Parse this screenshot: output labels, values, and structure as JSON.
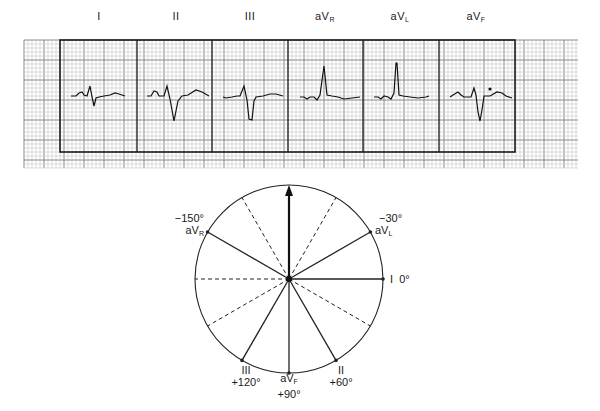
{
  "ecg_strip": {
    "leads": [
      {
        "name": "I",
        "sub": "",
        "x": 99
      },
      {
        "name": "II",
        "sub": "",
        "x": 176
      },
      {
        "name": "III",
        "sub": "",
        "x": 250
      },
      {
        "name": "aV",
        "sub": "R",
        "x": 325
      },
      {
        "name": "aV",
        "sub": "L",
        "x": 400
      },
      {
        "name": "aV",
        "sub": "F",
        "x": 476
      }
    ],
    "grid": {
      "x0": 24,
      "x1": 578,
      "y0": 40,
      "y1": 168,
      "small": 4,
      "large": 20
    },
    "frame": {
      "x0": 60,
      "x1": 515,
      "y0": 40,
      "y1": 152,
      "dividers": [
        137,
        212,
        288,
        363,
        439
      ]
    },
    "colors": {
      "grid_minor": "#b9b9b9",
      "grid_major": "#7d7d7d",
      "frame": "#1a1a1a",
      "trace": "#111111"
    }
  },
  "hexaxial": {
    "center": [
      289,
      279
    ],
    "radius": 94,
    "solid_axes": [
      {
        "lead": "I",
        "angle": 0
      },
      {
        "lead": "II",
        "angle": 60
      },
      {
        "lead": "aVF",
        "angle": 90
      },
      {
        "lead": "III",
        "angle": 120
      },
      {
        "lead": "aVR",
        "angle": -150
      },
      {
        "lead": "aVL",
        "angle": -30
      }
    ],
    "dashed_axes": [
      180,
      -120,
      -60,
      30,
      150
    ],
    "arrow_angle": -90,
    "labels": {
      "avr_deg": "−150°",
      "avr_lead": "aV",
      "avr_sub": "R",
      "avl_deg": "−30°",
      "avl_lead": "aV",
      "avl_sub": "L",
      "i_lead": "I",
      "i_deg": "0°",
      "iii_lead": "III",
      "iii_deg": "+120°",
      "avf_lead": "aV",
      "avf_sub": "F",
      "avf_deg": "+90°",
      "ii_lead": "II",
      "ii_deg": "+60°"
    }
  }
}
